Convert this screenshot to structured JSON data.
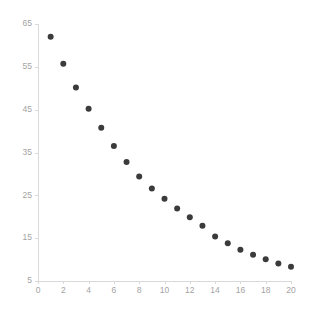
{
  "chart_data": {
    "type": "scatter",
    "title": "",
    "subtitle": "",
    "xlabel": "",
    "ylabel": "",
    "x": [
      1,
      2,
      3,
      4,
      5,
      6,
      7,
      8,
      9,
      10,
      11,
      12,
      13,
      14,
      15,
      16,
      17,
      18,
      19,
      20
    ],
    "values": [
      62.0,
      55.7,
      50.2,
      45.2,
      40.8,
      36.5,
      32.8,
      29.4,
      26.6,
      24.2,
      21.9,
      19.9,
      17.9,
      15.4,
      13.8,
      12.3,
      11.1,
      10.1,
      9.1,
      8.3
    ],
    "series": [
      {
        "name": "series-1",
        "values": [
          62.0,
          55.7,
          50.2,
          45.2,
          40.8,
          36.5,
          32.8,
          29.4,
          26.6,
          24.2,
          21.9,
          19.9,
          17.9,
          15.4,
          13.8,
          12.3,
          11.1,
          10.1,
          9.1,
          8.3
        ]
      }
    ],
    "xlim": [
      0,
      20
    ],
    "ylim": [
      5,
      65
    ],
    "xticks": [
      0,
      2,
      4,
      6,
      8,
      10,
      12,
      14,
      16,
      18,
      20
    ],
    "yticks": [
      5,
      15,
      25,
      35,
      45,
      55,
      65
    ],
    "xticklabels": [
      "0",
      "2",
      "4",
      "6",
      "8",
      "10",
      "12",
      "14",
      "16",
      "18",
      "20"
    ],
    "yticklabels": [
      "5",
      "15",
      "25",
      "35",
      "45",
      "55",
      "65"
    ],
    "grid": false,
    "legend": null,
    "legend_position": "none",
    "annotations": [],
    "marker": "circle",
    "marker_color": "#3b3b3b",
    "marker_size": 6,
    "axis_color": "#d9d9d9",
    "tick_label_color": "#a3a3a3",
    "background_color": "#ffffff"
  }
}
